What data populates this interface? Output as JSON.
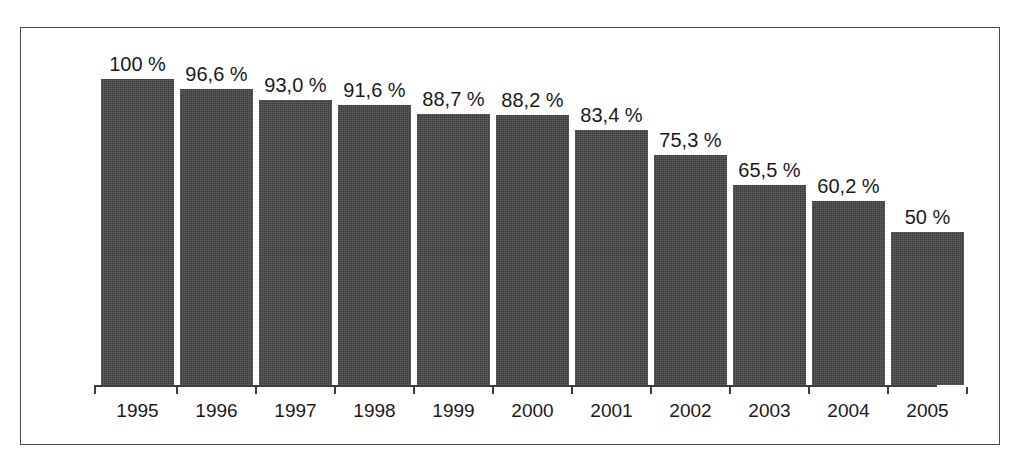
{
  "top_cut_caption": "",
  "chart_data": {
    "type": "bar",
    "title": "",
    "subtitle": "",
    "xlabel": "",
    "ylabel": "",
    "ylim": [
      0,
      100
    ],
    "grid": false,
    "legend": null,
    "bar_color": "#3b3b3b",
    "frame_color": "#4a4a4a",
    "axis_color": "#3d3d3d",
    "categories": [
      "1995",
      "1996",
      "1997",
      "1998",
      "1999",
      "2000",
      "2001",
      "2002",
      "2003",
      "2004",
      "2005"
    ],
    "values": [
      100,
      96.6,
      93.0,
      91.6,
      88.7,
      88.2,
      83.4,
      75.3,
      65.5,
      60.2,
      50
    ],
    "data_labels": [
      "100 %",
      "96,6 %",
      "93,0 %",
      "91,6 %",
      "88,7 %",
      "88,2 %",
      "83,4 %",
      "75,3 %",
      "65,5 %",
      "60,2 %",
      "50 %"
    ],
    "bars": [
      {
        "category": "1995",
        "value": 100,
        "label": "100 %"
      },
      {
        "category": "1996",
        "value": 96.6,
        "label": "96,6 %"
      },
      {
        "category": "1997",
        "value": 93.0,
        "label": "93,0 %"
      },
      {
        "category": "1998",
        "value": 91.6,
        "label": "91,6 %"
      },
      {
        "category": "1999",
        "value": 88.7,
        "label": "88,7 %"
      },
      {
        "category": "2000",
        "value": 88.2,
        "label": "88,2 %"
      },
      {
        "category": "2001",
        "value": 83.4,
        "label": "83,4 %"
      },
      {
        "category": "2002",
        "value": 75.3,
        "label": "75,3 %"
      },
      {
        "category": "2003",
        "value": 65.5,
        "label": "65,5 %"
      },
      {
        "category": "2004",
        "value": 60.2,
        "label": "60,2 %"
      },
      {
        "category": "2005",
        "value": 50,
        "label": "50 %"
      }
    ]
  }
}
